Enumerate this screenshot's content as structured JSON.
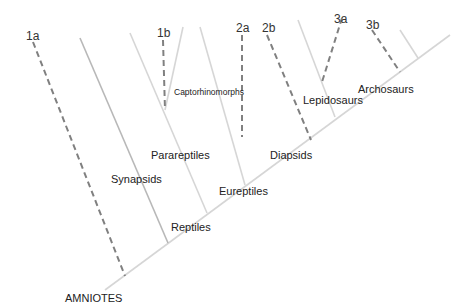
{
  "diagram": {
    "type": "cladogram",
    "colors": {
      "light_line": "#d6d6d6",
      "synapsid_line": "#b8b8b8",
      "dashed_line": "#808080",
      "text": "#222222"
    },
    "labels": {
      "amniotes": "AMNIOTES",
      "synapsids": "Synapsids",
      "reptiles": "Reptiles",
      "parareptiles": "Parareptiles",
      "eureptiles": "Eureptiles",
      "captorhinomorphs": "Captorhinomorphs",
      "diapsids": "Diapsids",
      "lepidosaurs": "Lepidosaurs",
      "archosaurs": "Archosaurs"
    },
    "markers": {
      "m1a": "1a",
      "m1b": "1b",
      "m2a": "2a",
      "m2b": "2b",
      "m3a": "3a",
      "m3b": "3b"
    }
  }
}
